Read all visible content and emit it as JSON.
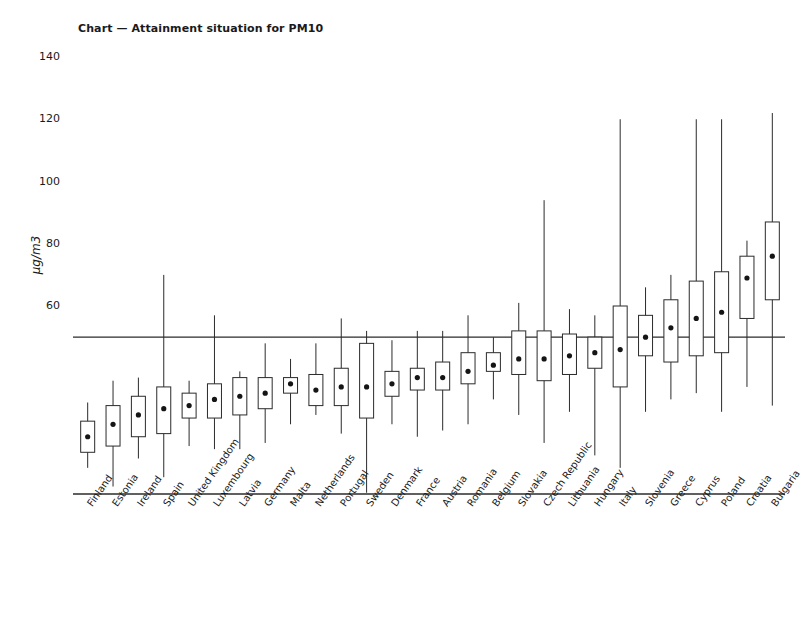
{
  "chart_data": {
    "type": "box",
    "title": "Chart — Attainment situation for PM10",
    "xlabel": "",
    "ylabel": "µg/m3",
    "ylim": [
      0,
      145
    ],
    "yticks": [
      60,
      80,
      100,
      120,
      140
    ],
    "grid": false,
    "legend": null,
    "reference_line": {
      "value": 50,
      "label": "",
      "style": "solid"
    },
    "categories": [
      "Finland",
      "Estonia",
      "Ireland",
      "Spain",
      "United Kingdom",
      "Luxembourg",
      "Latvia",
      "Germany",
      "Malta",
      "Netherlands",
      "Portugal",
      "Sweden",
      "Denmark",
      "France",
      "Austria",
      "Romania",
      "Belgium",
      "Slovakia",
      "Czech Republic",
      "Lithuania",
      "Hungary",
      "Italy",
      "Slovenia",
      "Greece",
      "Cyprus",
      "Poland",
      "Croatia",
      "Bulgaria"
    ],
    "series": [
      {
        "name": "PM10 daily concentration distribution",
        "boxes": [
          {
            "category": "Finland",
            "low": 30,
            "q1": 23,
            "median": 16,
            "q3": 11,
            "high": 7,
            "whisker_high": 29,
            "whisker_low": 8,
            "box_top": 23,
            "box_bottom": 13,
            "dot": 18
          },
          {
            "category": "Estonia",
            "low": 0,
            "q1": 0,
            "median": 0,
            "q3": 0,
            "high": 0,
            "whisker_high": 36,
            "whisker_low": 2,
            "box_top": 28,
            "box_bottom": 15,
            "dot": 22
          },
          {
            "category": "Ireland",
            "low": 0,
            "q1": 0,
            "median": 0,
            "q3": 0,
            "high": 0,
            "whisker_high": 37,
            "whisker_low": 11,
            "box_top": 31,
            "box_bottom": 18,
            "dot": 25
          },
          {
            "category": "Spain",
            "low": 0,
            "q1": 0,
            "median": 0,
            "q3": 0,
            "high": 0,
            "whisker_high": 70,
            "whisker_low": 5,
            "box_top": 34,
            "box_bottom": 19,
            "dot": 27
          },
          {
            "category": "United Kingdom",
            "low": 0,
            "q1": 0,
            "median": 0,
            "q3": 0,
            "high": 0,
            "whisker_high": 36,
            "whisker_low": 15,
            "box_top": 32,
            "box_bottom": 24,
            "dot": 28
          },
          {
            "category": "Luxembourg",
            "low": 0,
            "q1": 0,
            "median": 0,
            "q3": 0,
            "high": 0,
            "whisker_high": 57,
            "whisker_low": 14,
            "box_top": 35,
            "box_bottom": 24,
            "dot": 30
          },
          {
            "category": "Latvia",
            "low": 0,
            "q1": 0,
            "median": 0,
            "q3": 0,
            "high": 0,
            "whisker_high": 39,
            "whisker_low": 14,
            "box_top": 37,
            "box_bottom": 25,
            "dot": 31
          },
          {
            "category": "Germany",
            "low": 0,
            "q1": 0,
            "median": 0,
            "q3": 0,
            "high": 0,
            "whisker_high": 48,
            "whisker_low": 16,
            "box_top": 37,
            "box_bottom": 27,
            "dot": 32
          },
          {
            "category": "Malta",
            "low": 0,
            "q1": 0,
            "median": 0,
            "q3": 0,
            "high": 0,
            "whisker_high": 43,
            "whisker_low": 22,
            "box_top": 37,
            "box_bottom": 32,
            "dot": 35
          },
          {
            "category": "Netherlands",
            "low": 0,
            "q1": 0,
            "median": 0,
            "q3": 0,
            "high": 0,
            "whisker_high": 48,
            "whisker_low": 25,
            "box_top": 38,
            "box_bottom": 28,
            "dot": 33
          },
          {
            "category": "Portugal",
            "low": 0,
            "q1": 0,
            "median": 0,
            "q3": 0,
            "high": 0,
            "whisker_high": 56,
            "whisker_low": 19,
            "box_top": 40,
            "box_bottom": 28,
            "dot": 34
          },
          {
            "category": "Sweden",
            "low": 0,
            "q1": 0,
            "median": 0,
            "q3": 0,
            "high": 0,
            "whisker_high": 52,
            "whisker_low": 0,
            "box_top": 48,
            "box_bottom": 24,
            "dot": 34
          },
          {
            "category": "Denmark",
            "low": 0,
            "q1": 0,
            "median": 0,
            "q3": 0,
            "high": 0,
            "whisker_high": 49,
            "whisker_low": 22,
            "box_top": 39,
            "box_bottom": 31,
            "dot": 35
          },
          {
            "category": "France",
            "low": 0,
            "q1": 0,
            "median": 0,
            "q3": 0,
            "high": 0,
            "whisker_high": 52,
            "whisker_low": 18,
            "box_top": 40,
            "box_bottom": 33,
            "dot": 37
          },
          {
            "category": "Austria",
            "low": 0,
            "q1": 0,
            "median": 0,
            "q3": 0,
            "high": 0,
            "whisker_high": 52,
            "whisker_low": 20,
            "box_top": 42,
            "box_bottom": 33,
            "dot": 37
          },
          {
            "category": "Romania",
            "low": 0,
            "q1": 0,
            "median": 0,
            "q3": 0,
            "high": 0,
            "whisker_high": 57,
            "whisker_low": 22,
            "box_top": 45,
            "box_bottom": 35,
            "dot": 39
          },
          {
            "category": "Belgium",
            "low": 0,
            "q1": 0,
            "median": 0,
            "q3": 0,
            "high": 0,
            "whisker_high": 50,
            "whisker_low": 30,
            "box_top": 45,
            "box_bottom": 39,
            "dot": 41
          },
          {
            "category": "Slovakia",
            "low": 0,
            "q1": 0,
            "median": 0,
            "q3": 0,
            "high": 0,
            "whisker_high": 61,
            "whisker_low": 25,
            "box_top": 52,
            "box_bottom": 38,
            "dot": 43
          },
          {
            "category": "Czech Republic",
            "low": 0,
            "q1": 0,
            "median": 0,
            "q3": 0,
            "high": 0,
            "whisker_high": 94,
            "whisker_low": 16,
            "box_top": 52,
            "box_bottom": 36,
            "dot": 43
          },
          {
            "category": "Lithuania",
            "low": 0,
            "q1": 0,
            "median": 0,
            "q3": 0,
            "high": 0,
            "whisker_high": 59,
            "whisker_low": 26,
            "box_top": 51,
            "box_bottom": 38,
            "dot": 44
          },
          {
            "category": "Hungary",
            "low": 0,
            "q1": 0,
            "median": 0,
            "q3": 0,
            "high": 0,
            "whisker_high": 57,
            "whisker_low": 12,
            "box_top": 50,
            "box_bottom": 40,
            "dot": 45
          },
          {
            "category": "Italy",
            "low": 0,
            "q1": 0,
            "median": 0,
            "q3": 0,
            "high": 0,
            "whisker_high": 120,
            "whisker_low": 8,
            "box_top": 60,
            "box_bottom": 34,
            "dot": 46
          },
          {
            "category": "Slovenia",
            "low": 0,
            "q1": 0,
            "median": 0,
            "q3": 0,
            "high": 0,
            "whisker_high": 66,
            "whisker_low": 26,
            "box_top": 57,
            "box_bottom": 44,
            "dot": 50
          },
          {
            "category": "Greece",
            "low": 0,
            "q1": 0,
            "median": 0,
            "q3": 0,
            "high": 0,
            "whisker_high": 70,
            "whisker_low": 30,
            "box_top": 62,
            "box_bottom": 42,
            "dot": 53
          },
          {
            "category": "Cyprus",
            "low": 0,
            "q1": 0,
            "median": 0,
            "q3": 0,
            "high": 0,
            "whisker_high": 120,
            "whisker_low": 32,
            "box_top": 68,
            "box_bottom": 44,
            "dot": 56
          },
          {
            "category": "Poland",
            "low": 0,
            "q1": 0,
            "median": 0,
            "q3": 0,
            "high": 0,
            "whisker_high": 120,
            "whisker_low": 26,
            "box_top": 71,
            "box_bottom": 45,
            "dot": 58
          },
          {
            "category": "Croatia",
            "low": 0,
            "q1": 0,
            "median": 0,
            "q3": 0,
            "high": 0,
            "whisker_high": 81,
            "whisker_low": 34,
            "box_top": 76,
            "box_bottom": 56,
            "dot": 69
          },
          {
            "category": "Bulgaria",
            "low": 0,
            "q1": 0,
            "median": 0,
            "q3": 0,
            "high": 0,
            "whisker_high": 122,
            "whisker_low": 28,
            "box_top": 87,
            "box_bottom": 62,
            "dot": 76
          }
        ]
      }
    ]
  },
  "colors": {
    "line": "#2b2b2b",
    "box_fill": "#ffffff",
    "dot": "#151515",
    "text": "#1a1a1a",
    "background": "#ffffff"
  }
}
